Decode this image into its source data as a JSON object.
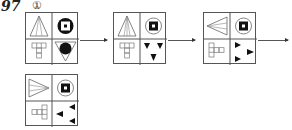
{
  "question": {
    "number": "97",
    "option": "①"
  },
  "sequence": [
    {
      "id": 1,
      "tl": "triangle-up-striped",
      "tr": "black-ring-square",
      "bl": "t-cross-up",
      "br": "triangle-down-black-circle"
    },
    {
      "id": 2,
      "tl": "triangle-up-striped",
      "tr": "circle-black-square",
      "bl": "t-cross-up",
      "br": "three-black-triangles-down"
    },
    {
      "id": 3,
      "tl": "triangle-left-striped",
      "tr": "circle-black-square",
      "bl": "t-cross-right",
      "br": "three-black-triangles-right"
    },
    {
      "id": 4,
      "tl": "triangle-right-striped",
      "tr": "circle-black-square",
      "bl": "t-cross-left",
      "br": "three-black-triangles-left"
    }
  ],
  "colors": {
    "line": "#555555",
    "fill": "#111111"
  }
}
